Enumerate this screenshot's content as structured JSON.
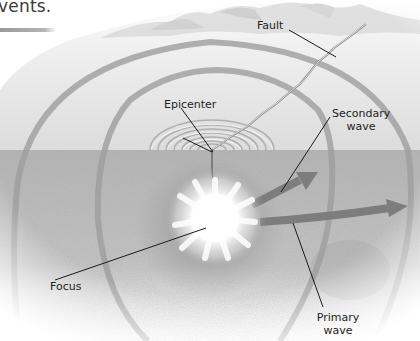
{
  "heading": {
    "text_fragment": "vents.",
    "rule_color": "#a0a0a0"
  },
  "diagram": {
    "labels": {
      "fault": "Fault",
      "epicenter": "Epicenter",
      "secondary_wave_line1": "Secondary",
      "secondary_wave_line2": "wave",
      "focus": "Focus",
      "primary_wave_line1": "Primary",
      "primary_wave_line2": "wave"
    },
    "colors": {
      "sky_surface": "#ededed",
      "underground": "#b8b8b8",
      "wave_front": "#9c9c9c",
      "arrow": "#7a7a7a",
      "leader_line": "#1a1a1a",
      "focus_glow": "#ffffff"
    },
    "elements": [
      "mountains",
      "ground-surface",
      "underground-crust",
      "fault-crack",
      "epicenter-ripples",
      "wave-fronts",
      "focus-burst",
      "secondary-wave-arrow",
      "primary-wave-arrow"
    ]
  }
}
